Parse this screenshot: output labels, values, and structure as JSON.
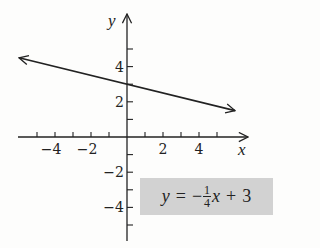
{
  "chart_data": {
    "type": "line",
    "title": "",
    "xlabel": "x",
    "ylabel": "y",
    "xlim": [
      -5.8,
      6.2
    ],
    "ylim": [
      -5.8,
      6.5
    ],
    "x_ticks": [
      -5,
      -4,
      -3,
      -2,
      -1,
      1,
      2,
      3,
      4,
      5
    ],
    "x_tick_labels": [
      {
        "value": -4,
        "label": "−4"
      },
      {
        "value": -2,
        "label": "−2"
      },
      {
        "value": 2,
        "label": "2"
      },
      {
        "value": 4,
        "label": "4"
      }
    ],
    "y_ticks": [
      -5,
      -4,
      -3,
      -2,
      -1,
      1,
      2,
      3,
      4,
      5
    ],
    "y_tick_labels": [
      {
        "value": 4,
        "label": "4"
      },
      {
        "value": 2,
        "label": "2"
      },
      {
        "value": -2,
        "label": "−2"
      },
      {
        "value": -4,
        "label": "−4"
      }
    ],
    "grid": false,
    "series": [
      {
        "name": "y = -1/4 x + 3",
        "slope": -0.25,
        "intercept": 3,
        "x": [
          -6,
          6
        ],
        "y": [
          4.5,
          1.5
        ],
        "arrows": "both"
      }
    ],
    "annotations": [
      {
        "text": "y = −(1/4)x + 3",
        "position": "lower-right",
        "background": "#d2d2d2"
      }
    ]
  },
  "equation": {
    "lhs": "y",
    "eq": "=",
    "minus": "−",
    "num": "1",
    "den": "4",
    "var": "x",
    "plus": "+",
    "const": "3"
  },
  "colors": {
    "line": "#222222",
    "axis": "#222222",
    "label_bg": "#d2d2d2"
  }
}
